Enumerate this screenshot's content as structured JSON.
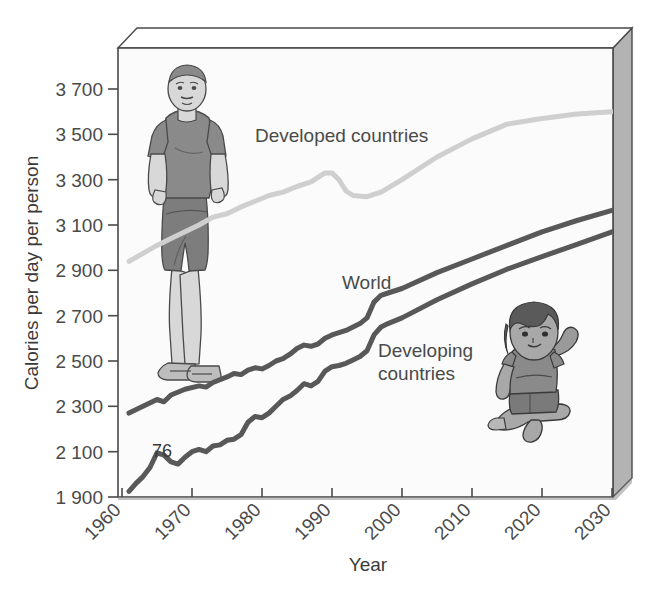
{
  "chart_data": {
    "type": "line",
    "title": "",
    "xlabel": "Year",
    "ylabel": "Calories per day per person",
    "xlim": [
      1960,
      2030
    ],
    "ylim": [
      1900,
      3700
    ],
    "grid": false,
    "legend_position": "inline-labels",
    "xticks": [
      "1960",
      "1970",
      "1980",
      "1990",
      "2000",
      "2010",
      "2020",
      "2030"
    ],
    "yticks": [
      "1 900",
      "2 100",
      "2 300",
      "2 500",
      "2 700",
      "2 900",
      "3 100",
      "3 300",
      "3 500",
      "3 700"
    ],
    "annotations": [
      {
        "text": "76",
        "x": 1975,
        "y": 2150
      }
    ],
    "series": [
      {
        "name": "Developed countries",
        "color": "#cfcfcf",
        "label_x": 1979,
        "label_y": 3460,
        "points": [
          [
            1961,
            2940
          ],
          [
            1963,
            2975
          ],
          [
            1965,
            3010
          ],
          [
            1967,
            3040
          ],
          [
            1969,
            3070
          ],
          [
            1971,
            3100
          ],
          [
            1973,
            3135
          ],
          [
            1975,
            3150
          ],
          [
            1977,
            3180
          ],
          [
            1979,
            3205
          ],
          [
            1981,
            3230
          ],
          [
            1983,
            3245
          ],
          [
            1985,
            3270
          ],
          [
            1987,
            3290
          ],
          [
            1989,
            3330
          ],
          [
            1990,
            3330
          ],
          [
            1991,
            3300
          ],
          [
            1992,
            3250
          ],
          [
            1993,
            3230
          ],
          [
            1995,
            3225
          ],
          [
            1997,
            3245
          ],
          [
            2000,
            3300
          ],
          [
            2005,
            3400
          ],
          [
            2010,
            3480
          ],
          [
            2015,
            3545
          ],
          [
            2020,
            3570
          ],
          [
            2025,
            3590
          ],
          [
            2030,
            3600
          ]
        ]
      },
      {
        "name": "World",
        "color": "#585858",
        "label_x": 1995,
        "label_y": 2850,
        "points": [
          [
            1961,
            2270
          ],
          [
            1963,
            2300
          ],
          [
            1965,
            2330
          ],
          [
            1966,
            2320
          ],
          [
            1967,
            2350
          ],
          [
            1969,
            2375
          ],
          [
            1971,
            2390
          ],
          [
            1972,
            2385
          ],
          [
            1973,
            2405
          ],
          [
            1975,
            2430
          ],
          [
            1976,
            2445
          ],
          [
            1977,
            2440
          ],
          [
            1978,
            2460
          ],
          [
            1979,
            2470
          ],
          [
            1980,
            2465
          ],
          [
            1981,
            2480
          ],
          [
            1982,
            2500
          ],
          [
            1983,
            2510
          ],
          [
            1984,
            2530
          ],
          [
            1985,
            2555
          ],
          [
            1986,
            2570
          ],
          [
            1987,
            2565
          ],
          [
            1988,
            2575
          ],
          [
            1989,
            2600
          ],
          [
            1990,
            2615
          ],
          [
            1991,
            2625
          ],
          [
            1992,
            2635
          ],
          [
            1993,
            2650
          ],
          [
            1994,
            2665
          ],
          [
            1995,
            2690
          ],
          [
            1996,
            2760
          ],
          [
            1997,
            2790
          ],
          [
            1998,
            2800
          ],
          [
            2000,
            2820
          ],
          [
            2005,
            2890
          ],
          [
            2010,
            2950
          ],
          [
            2015,
            3010
          ],
          [
            2020,
            3070
          ],
          [
            2025,
            3120
          ],
          [
            2030,
            3165
          ]
        ]
      },
      {
        "name": "Developing countries",
        "color": "#585858",
        "label_x": 1999,
        "label_y": 2560,
        "points": [
          [
            1961,
            1925
          ],
          [
            1962,
            1960
          ],
          [
            1963,
            1990
          ],
          [
            1964,
            2030
          ],
          [
            1965,
            2095
          ],
          [
            1966,
            2085
          ],
          [
            1967,
            2055
          ],
          [
            1968,
            2045
          ],
          [
            1969,
            2075
          ],
          [
            1970,
            2100
          ],
          [
            1971,
            2110
          ],
          [
            1972,
            2100
          ],
          [
            1973,
            2125
          ],
          [
            1974,
            2130
          ],
          [
            1975,
            2150
          ],
          [
            1976,
            2155
          ],
          [
            1977,
            2175
          ],
          [
            1978,
            2230
          ],
          [
            1979,
            2255
          ],
          [
            1980,
            2250
          ],
          [
            1981,
            2270
          ],
          [
            1982,
            2300
          ],
          [
            1983,
            2330
          ],
          [
            1984,
            2345
          ],
          [
            1985,
            2370
          ],
          [
            1986,
            2400
          ],
          [
            1987,
            2390
          ],
          [
            1988,
            2410
          ],
          [
            1989,
            2455
          ],
          [
            1990,
            2475
          ],
          [
            1991,
            2480
          ],
          [
            1992,
            2490
          ],
          [
            1993,
            2505
          ],
          [
            1994,
            2520
          ],
          [
            1995,
            2545
          ],
          [
            1996,
            2615
          ],
          [
            1997,
            2650
          ],
          [
            1998,
            2665
          ],
          [
            2000,
            2690
          ],
          [
            2005,
            2770
          ],
          [
            2010,
            2840
          ],
          [
            2015,
            2905
          ],
          [
            2020,
            2960
          ],
          [
            2025,
            3015
          ],
          [
            2030,
            3070
          ]
        ]
      }
    ]
  },
  "illustrations": [
    {
      "name": "obese-adult-figure",
      "shirt_color": "#8a8a8a",
      "shorts_color": "#7a7a7a",
      "skin_color": "#d8d8d8"
    },
    {
      "name": "malnourished-child-figure",
      "shirt_color": "#8a8a8a",
      "shorts_color": "#7a7a7a",
      "hair_color": "#5a5a5a"
    }
  ],
  "frame": {
    "panel_color": "#b3b3b3",
    "plot_bg": "#fbfbfb",
    "border_color": "#4a4a4a"
  }
}
